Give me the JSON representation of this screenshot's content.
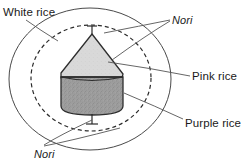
{
  "figure": {
    "background_color": "#ffffff",
    "width": 252,
    "height": 166,
    "style": "hand-drawn line diagram, grayscale"
  },
  "labels": {
    "white_rice": "White rice",
    "nori_top": "Nori",
    "pink_rice": "Pink rice",
    "purple_rice": "Purple rice",
    "nori_bottom": "Nori"
  },
  "shapes": {
    "outer_circle": {
      "name": "White rice outer layer",
      "center_x": 90,
      "center_y": 79,
      "radius": 81,
      "stroke": "#4a4a4a",
      "stroke_width": 1,
      "dash": "none",
      "fill": "none"
    },
    "inner_circle": {
      "name": "Nori dashed layer",
      "center_x": 91,
      "center_y": 78,
      "radius": 60,
      "stroke": "#2b2b2b",
      "stroke_width": 1.2,
      "dash": "4 3",
      "fill": "none"
    },
    "cone": {
      "name": "Pink rice cone top",
      "fill": "#d9d9d9",
      "stroke": "#2e2e2e",
      "apex_x": 92,
      "apex_y": 34,
      "left_x": 62,
      "right_x": 122,
      "base_y": 76
    },
    "cylinder": {
      "name": "Purple rice cylinder base",
      "fill": "#9a9a9a",
      "stroke": "#2e2e2e",
      "left_x": 61,
      "right_x": 123,
      "top_y": 76,
      "bottom_y": 114,
      "ellipse_ry": 7
    },
    "tick_top": {
      "name": "Top nori tick",
      "x": 92,
      "y_start": 26,
      "y_end": 35
    },
    "tick_bottom": {
      "name": "Bottom nori tick",
      "x": 92,
      "y_start": 114,
      "y_end": 124
    }
  },
  "colors": {
    "stroke": "#3a3a3a",
    "text": "#1a1a1a",
    "cone_fill": "#d9d9d9",
    "cylinder_fill": "#9a9a9a",
    "background": "#ffffff"
  },
  "leader_lines": [
    {
      "name": "white-rice-leader",
      "from_label": "White rice",
      "to_target": "outer circle / dashed layer"
    },
    {
      "name": "nori-top-leader-a",
      "from_label": "Nori",
      "to_target": "dashed inner circle"
    },
    {
      "name": "nori-top-leader-b",
      "from_label": "Nori",
      "to_target": "cone surface"
    },
    {
      "name": "pink-rice-leader",
      "from_label": "Pink rice",
      "to_target": "cone top region"
    },
    {
      "name": "purple-rice-leader",
      "from_label": "Purple rice",
      "to_target": "cylinder base region"
    },
    {
      "name": "nori-bottom-leader-a",
      "from_label": "Nori",
      "to_target": "bottom tick"
    },
    {
      "name": "nori-bottom-leader-b",
      "from_label": "Nori",
      "to_target": "outer circle bottom"
    }
  ]
}
